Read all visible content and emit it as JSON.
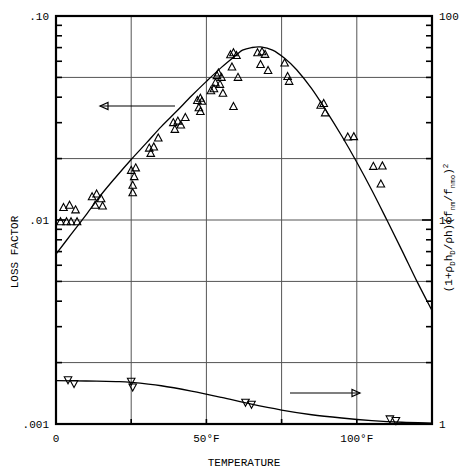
{
  "figure": {
    "xlabel": "TEMPERATURE",
    "ylabel_left": "LOSS FACTOR",
    "ylabel_right_parts": {
      "p1": "(1+",
      "p2": "D",
      "p3": "h",
      "p4": "D",
      "p5": "/",
      "p6": "h)(f",
      "p7": "nm",
      "p8": "/f",
      "p9": "nmo",
      "p10": ")",
      "p11": "2",
      "rho1": "ρ",
      "rho2": "ρ"
    },
    "ylabel_right_plain": "(1+ρD hD/ρh)(f nm/f nmo)2"
  },
  "axes": {
    "x_ticks": [
      "0",
      "50°F",
      "100°F"
    ],
    "x_tick_values": [
      0,
      50,
      100
    ],
    "x_range": [
      0,
      125
    ],
    "x_gridlines": [
      0,
      25,
      50,
      75,
      100,
      125
    ],
    "y_left_ticks": [
      ".10",
      ".01",
      ".001"
    ],
    "y_left_values": [
      0.1,
      0.01,
      0.001
    ],
    "y_left_range": [
      0.001,
      0.1
    ],
    "y_right_ticks": [
      "100",
      "10",
      "1"
    ],
    "y_right_values": [
      100,
      10,
      1
    ],
    "y_right_range": [
      1,
      100
    ],
    "y_gridlines_left": [
      0.001,
      0.002,
      0.005,
      0.01,
      0.02,
      0.05,
      0.1
    ],
    "scale": "log"
  },
  "annotations": {
    "left_arrow_label": "left-pointing arrow indicating left axis",
    "right_arrow_label": "right-pointing arrow indicating right axis"
  },
  "chart_data": {
    "type": "scatter",
    "title": "",
    "xlabel": "TEMPERATURE",
    "ylabel": "LOSS FACTOR",
    "ylabel_secondary": "(1+ρD hD/ρh)(f nm/f nmo)2",
    "xlim": [
      0,
      125
    ],
    "ylim": [
      0.001,
      0.1
    ],
    "ylim_secondary": [
      1,
      100
    ],
    "yscale": "log",
    "grid": true,
    "legend": "none",
    "series": [
      {
        "name": "loss factor (up triangles, left axis)",
        "marker": "triangle-up",
        "axis": "left",
        "points": [
          [
            1.5,
            0.0098
          ],
          [
            3.5,
            0.0098
          ],
          [
            5.0,
            0.0098
          ],
          [
            7.0,
            0.0098
          ],
          [
            2.5,
            0.0115
          ],
          [
            4.5,
            0.0118
          ],
          [
            6.5,
            0.0112
          ],
          [
            12.0,
            0.013
          ],
          [
            13.5,
            0.0134
          ],
          [
            15.0,
            0.0127
          ],
          [
            13.0,
            0.0118
          ],
          [
            15.5,
            0.0117
          ],
          [
            25.0,
            0.0175
          ],
          [
            26.5,
            0.018
          ],
          [
            26.0,
            0.0163
          ],
          [
            25.5,
            0.0148
          ],
          [
            25.5,
            0.0136
          ],
          [
            31.0,
            0.0225
          ],
          [
            32.5,
            0.0228
          ],
          [
            31.5,
            0.0212
          ],
          [
            34.0,
            0.0252
          ],
          [
            39.0,
            0.03
          ],
          [
            40.5,
            0.0305
          ],
          [
            41.5,
            0.0292
          ],
          [
            39.5,
            0.0278
          ],
          [
            43.0,
            0.0318
          ],
          [
            47.0,
            0.0385
          ],
          [
            48.0,
            0.0395
          ],
          [
            48.5,
            0.0382
          ],
          [
            47.5,
            0.0355
          ],
          [
            48.0,
            0.034
          ],
          [
            51.5,
            0.043
          ],
          [
            52.5,
            0.044
          ],
          [
            53.5,
            0.051
          ],
          [
            54.0,
            0.0525
          ],
          [
            55.0,
            0.05
          ],
          [
            53.0,
            0.047
          ],
          [
            54.5,
            0.0462
          ],
          [
            55.5,
            0.0418
          ],
          [
            58.0,
            0.0645
          ],
          [
            59.0,
            0.066
          ],
          [
            60.0,
            0.064
          ],
          [
            58.5,
            0.0562
          ],
          [
            60.5,
            0.05
          ],
          [
            59.0,
            0.036
          ],
          [
            67.0,
            0.066
          ],
          [
            68.5,
            0.0668
          ],
          [
            69.5,
            0.0648
          ],
          [
            68.0,
            0.0578
          ],
          [
            70.5,
            0.054
          ],
          [
            76.0,
            0.0588
          ],
          [
            77.0,
            0.0505
          ],
          [
            77.5,
            0.0478
          ],
          [
            88.0,
            0.0365
          ],
          [
            89.0,
            0.0372
          ],
          [
            89.5,
            0.0335
          ],
          [
            97.0,
            0.0255
          ],
          [
            99.0,
            0.0256
          ],
          [
            105.5,
            0.0183
          ],
          [
            108.5,
            0.0184
          ],
          [
            108.0,
            0.015
          ]
        ]
      },
      {
        "name": "correction factor (down triangles, right axis)",
        "marker": "triangle-down",
        "axis": "right",
        "points": [
          [
            4.0,
            1.65
          ],
          [
            6.0,
            1.58
          ],
          [
            25.0,
            1.62
          ],
          [
            25.5,
            1.52
          ],
          [
            63.0,
            1.28
          ],
          [
            65.0,
            1.25
          ],
          [
            111.0,
            1.06
          ],
          [
            113.0,
            1.04
          ]
        ]
      }
    ],
    "curves": [
      {
        "name": "fitted loss factor curve (left axis)",
        "axis": "left",
        "points": [
          [
            0,
            0.0068
          ],
          [
            5,
            0.0085
          ],
          [
            10,
            0.0106
          ],
          [
            15,
            0.0133
          ],
          [
            20,
            0.0163
          ],
          [
            25,
            0.0198
          ],
          [
            30,
            0.0238
          ],
          [
            35,
            0.0287
          ],
          [
            40,
            0.034
          ],
          [
            45,
            0.0405
          ],
          [
            50,
            0.0478
          ],
          [
            55,
            0.056
          ],
          [
            60,
            0.0645
          ],
          [
            62,
            0.068
          ],
          [
            65,
            0.07
          ],
          [
            68,
            0.0705
          ],
          [
            72,
            0.068
          ],
          [
            76,
            0.062
          ],
          [
            80,
            0.0545
          ],
          [
            85,
            0.044
          ],
          [
            90,
            0.034
          ],
          [
            95,
            0.0258
          ],
          [
            100,
            0.0192
          ],
          [
            105,
            0.014
          ],
          [
            110,
            0.01
          ],
          [
            115,
            0.0071
          ],
          [
            120,
            0.005
          ],
          [
            125,
            0.0036
          ]
        ]
      },
      {
        "name": "fitted correction curve (right axis)",
        "axis": "right",
        "points": [
          [
            0,
            1.63
          ],
          [
            10,
            1.625
          ],
          [
            20,
            1.615
          ],
          [
            25,
            1.6
          ],
          [
            35,
            1.54
          ],
          [
            45,
            1.45
          ],
          [
            55,
            1.35
          ],
          [
            65,
            1.25
          ],
          [
            75,
            1.17
          ],
          [
            85,
            1.11
          ],
          [
            95,
            1.07
          ],
          [
            105,
            1.04
          ],
          [
            115,
            1.02
          ],
          [
            125,
            1.01
          ]
        ]
      }
    ]
  }
}
